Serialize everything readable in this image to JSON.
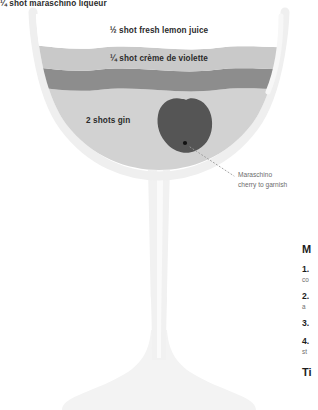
{
  "diagram": {
    "glass_type": "coupe-glass"
  },
  "layers": [
    {
      "id": "lemon",
      "label": "½ shot fresh lemon juice",
      "color": "#ffffff"
    },
    {
      "id": "violette",
      "label": "¼ shot crème de violette",
      "color": "#c9c9c9"
    },
    {
      "id": "maraschino",
      "label": "¼ shot maraschino liqueur",
      "color": "#8d8d8d"
    },
    {
      "id": "gin",
      "label": "2 shots gin",
      "color": "#d2d2d2"
    }
  ],
  "garnish": {
    "line1": "Maraschino",
    "line2": "cherry to garnish",
    "color": "#555555",
    "pit_color": "#111111"
  },
  "method": {
    "heading": "M",
    "steps": [
      {
        "number": "1.",
        "body": "co"
      },
      {
        "number": "2.",
        "body": "a"
      },
      {
        "number": "3.",
        "body": ""
      },
      {
        "number": "4.",
        "body": "st"
      }
    ],
    "tip_heading": "Ti"
  },
  "colors": {
    "glass_outline": "#ededed",
    "glass_shade": "#f4f4f4",
    "text_dark": "#2b2b2b",
    "text_muted": "#6d6d6d",
    "leader_line": "#9a9a9a"
  }
}
